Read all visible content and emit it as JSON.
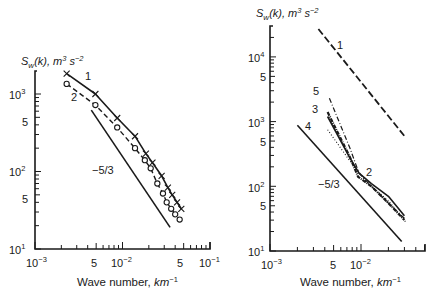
{
  "chart_data": [
    {
      "type": "line",
      "title": "",
      "ylabel": "S_w(k), m^3 s^-2",
      "xlabel": "Wave number, km^-1",
      "xscale": "log",
      "yscale": "log",
      "xlim": [
        0.001,
        0.1
      ],
      "ylim": [
        10,
        2000
      ],
      "x_tick_labels": [
        "10^-3",
        "5",
        "10^-2",
        "5",
        "10^-1"
      ],
      "y_tick_labels": [
        "10^1",
        "5",
        "10^2",
        "5",
        "10^3"
      ],
      "grid": false,
      "series": [
        {
          "name": "1",
          "marker": "x",
          "style": "solid",
          "x": [
            0.0023,
            0.0049,
            0.0087,
            0.0139,
            0.0185,
            0.022,
            0.028,
            0.033,
            0.037,
            0.042,
            0.047
          ],
          "y": [
            1830,
            1000,
            490,
            285,
            170,
            130,
            88,
            62,
            50,
            40,
            33
          ]
        },
        {
          "name": "2",
          "marker": "o",
          "style": "dashed",
          "x": [
            0.0023,
            0.0049,
            0.0087,
            0.0139,
            0.018,
            0.021,
            0.025,
            0.029,
            0.032,
            0.036,
            0.04,
            0.045
          ],
          "y": [
            1350,
            720,
            370,
            200,
            140,
            110,
            70,
            52,
            40,
            33,
            28,
            24
          ]
        },
        {
          "name": "-5/3",
          "marker": "none",
          "style": "solid",
          "x": [
            0.0044,
            0.035
          ],
          "y": [
            620,
            19
          ]
        }
      ],
      "annotations": [
        "1",
        "2",
        "-5/3"
      ]
    },
    {
      "type": "line",
      "title": "",
      "ylabel": "S_w(k), m^3 s^-2",
      "xlabel": "Wave number, km^-1",
      "xscale": "log",
      "yscale": "log",
      "xlim": [
        0.001,
        0.04
      ],
      "ylim": [
        10,
        30000
      ],
      "x_tick_labels": [
        "10^-3",
        "5",
        "10^-2"
      ],
      "y_tick_labels": [
        "10^1",
        "5",
        "10^2",
        "5",
        "10^3",
        "5",
        "10^4"
      ],
      "grid": false,
      "series": [
        {
          "name": "1",
          "style": "long-dash",
          "x": [
            0.0034,
            0.03
          ],
          "y": [
            27000,
            600
          ]
        },
        {
          "name": "2",
          "style": "solid",
          "x": [
            0.0043,
            0.0075,
            0.0095,
            0.013,
            0.02,
            0.03
          ],
          "y": [
            1200,
            280,
            160,
            110,
            70,
            35
          ]
        },
        {
          "name": "3",
          "style": "dash-dot-heavy",
          "x": [
            0.0043,
            0.0075,
            0.0093,
            0.013,
            0.02,
            0.03
          ],
          "y": [
            1400,
            290,
            140,
            100,
            55,
            30
          ]
        },
        {
          "name": "4",
          "style": "dotted",
          "x": [
            0.0043,
            0.0075,
            0.012,
            0.02,
            0.031
          ],
          "y": [
            750,
            250,
            110,
            60,
            28
          ]
        },
        {
          "name": "5",
          "style": "dash-dot",
          "x": [
            0.0045,
            0.0075,
            0.0095,
            0.013,
            0.02,
            0.03
          ],
          "y": [
            2300,
            400,
            160,
            100,
            55,
            32
          ]
        },
        {
          "name": "-5/3",
          "style": "solid",
          "x": [
            0.002,
            0.028
          ],
          "y": [
            880,
            14
          ]
        }
      ],
      "annotations": [
        "1",
        "2",
        "3",
        "4",
        "5",
        "-5/3"
      ]
    }
  ],
  "labels": {
    "y_title_left": "S",
    "y_title_sub": "w",
    "y_title_rest": "(k), m",
    "y_title_exp": "3",
    "y_title_s": " s",
    "y_title_sexp": "−2",
    "x_title_main": "Wave number, ",
    "x_title_unit": "km",
    "x_title_exp": "−1",
    "left_curve1": "1",
    "left_curve2": "2",
    "left_slope": "−5/3",
    "right_curve1": "1",
    "right_curve2": "2",
    "right_curve3": "3",
    "right_curve4": "4",
    "right_curve5": "5",
    "right_slope": "−5/3",
    "tick_10": "10",
    "tick_5": "5",
    "exp_m3": "−3",
    "exp_m2": "−2",
    "exp_m1": "−1",
    "exp_1": "1",
    "exp_2": "2",
    "exp_3": "3",
    "exp_4": "4"
  }
}
